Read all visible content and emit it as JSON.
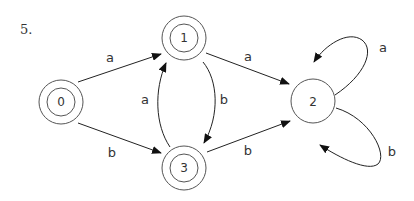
{
  "problem_number": "5.",
  "automaton": {
    "states": [
      {
        "id": "0",
        "label": "0",
        "accepting": true
      },
      {
        "id": "1",
        "label": "1",
        "accepting": true
      },
      {
        "id": "2",
        "label": "2",
        "accepting": false
      },
      {
        "id": "3",
        "label": "3",
        "accepting": true
      }
    ],
    "transitions": [
      {
        "from": "0",
        "to": "1",
        "symbol": "a"
      },
      {
        "from": "0",
        "to": "3",
        "symbol": "b"
      },
      {
        "from": "1",
        "to": "2",
        "symbol": "a"
      },
      {
        "from": "1",
        "to": "3",
        "symbol": "b"
      },
      {
        "from": "3",
        "to": "1",
        "symbol": "a"
      },
      {
        "from": "3",
        "to": "2",
        "symbol": "b"
      },
      {
        "from": "2",
        "to": "2",
        "symbol": "a"
      },
      {
        "from": "2",
        "to": "2",
        "symbol": "b"
      }
    ]
  }
}
